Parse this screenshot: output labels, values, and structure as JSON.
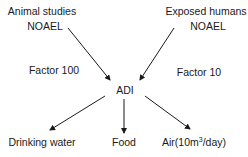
{
  "diagram": {
    "sources": [
      {
        "id": "animal",
        "line1": "Animal studies",
        "line2": "NOAEL",
        "factor": "Factor 100"
      },
      {
        "id": "human",
        "line1": "Exposed humans",
        "line2": "NOAEL",
        "factor": "Factor 10"
      }
    ],
    "center": {
      "label": "ADI"
    },
    "outputs": [
      {
        "id": "water",
        "label": "Drinking water"
      },
      {
        "id": "food",
        "label": "Food"
      },
      {
        "id": "air",
        "label_prefix": "Air(10m",
        "label_sup": "3",
        "label_suffix": "/day)"
      }
    ],
    "edges": [
      {
        "from": "animal",
        "to": "ADI"
      },
      {
        "from": "human",
        "to": "ADI"
      },
      {
        "from": "ADI",
        "to": "water"
      },
      {
        "from": "ADI",
        "to": "food"
      },
      {
        "from": "ADI",
        "to": "air"
      }
    ],
    "arrow_color": "#1a1a1a"
  }
}
